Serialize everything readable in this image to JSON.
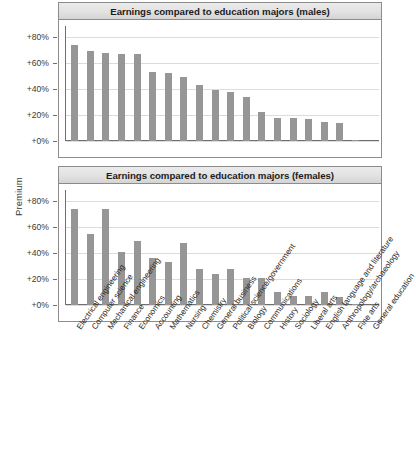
{
  "figure": {
    "ylabel": "Premium",
    "caption": ""
  },
  "chart_data": [
    {
      "type": "bar",
      "title": "Earnings compared to education majors (males)",
      "xlabel": "",
      "ylabel": "Premium",
      "ylim": [
        0,
        90
      ],
      "grid": true,
      "legend": false,
      "tick_labels": [
        "+0%",
        "+20%",
        "+40%",
        "+60%",
        "+80%"
      ],
      "tick_values": [
        0,
        20,
        40,
        60,
        80
      ],
      "categories": [
        "Electrical engineering",
        "Computer science",
        "Mechanical engineering",
        "Finance",
        "Economics",
        "Accounting",
        "Mathematics",
        "Nursing",
        "Chemistry",
        "General business",
        "Political science/government",
        "Biology",
        "Communications",
        "History",
        "Sociology",
        "Liberal arts",
        "English language and literature",
        "Anthropology/archaeology",
        "Fine arts",
        "General education"
      ],
      "values": [
        74,
        69,
        68,
        67,
        67,
        53,
        52,
        49,
        43,
        39,
        38,
        34,
        22,
        18,
        18,
        17,
        15,
        14,
        1,
        0
      ]
    },
    {
      "type": "bar",
      "title": "Earnings compared to education majors (females)",
      "xlabel": "",
      "ylabel": "Premium",
      "ylim": [
        0,
        90
      ],
      "grid": true,
      "legend": false,
      "tick_labels": [
        "+0%",
        "+20%",
        "+40%",
        "+60%",
        "+80%"
      ],
      "tick_values": [
        0,
        20,
        40,
        60,
        80
      ],
      "categories": [
        "Electrical engineering",
        "Computer science",
        "Mechanical engineering",
        "Finance",
        "Economics",
        "Accounting",
        "Mathematics",
        "Nursing",
        "Chemistry",
        "General business",
        "Political science/government",
        "Biology",
        "Communications",
        "History",
        "Sociology",
        "Liberal arts",
        "English language and literature",
        "Anthropology/archaeology",
        "Fine arts",
        "General education"
      ],
      "values": [
        74,
        55,
        74,
        41,
        49,
        36,
        33,
        48,
        28,
        24,
        28,
        21,
        21,
        10,
        7,
        7,
        10,
        6,
        1,
        0
      ]
    }
  ]
}
